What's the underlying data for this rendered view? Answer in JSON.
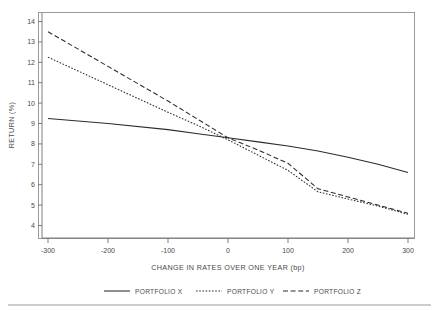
{
  "chart_data": {
    "type": "line",
    "title": "",
    "xlabel": "CHANGE IN RATES OVER ONE YEAR (bp)",
    "ylabel": "RETURN (%)",
    "xlim": [
      -300,
      300
    ],
    "ylim": [
      4,
      14
    ],
    "xticks": [
      -300,
      -200,
      -100,
      0,
      100,
      200,
      300
    ],
    "xtick_labels": [
      "-300",
      "-200",
      "-100",
      "0",
      "100",
      "200",
      "300"
    ],
    "yticks": [
      4,
      5,
      6,
      7,
      8,
      9,
      10,
      11,
      12,
      13,
      14
    ],
    "ytick_labels": [
      "4",
      "5",
      "6",
      "7",
      "8",
      "9",
      "10",
      "11",
      "12",
      "13",
      "14"
    ],
    "grid": false,
    "legend_position": "below",
    "series": [
      {
        "name": "PORTFOLIO X",
        "style": "solid",
        "x": [
          -300,
          -200,
          -100,
          -50,
          0,
          50,
          100,
          150,
          200,
          250,
          300
        ],
        "values": [
          9.25,
          9.0,
          8.7,
          8.5,
          8.3,
          8.1,
          7.9,
          7.65,
          7.35,
          7.0,
          6.6
        ]
      },
      {
        "name": "PORTFOLIO Y",
        "style": "dotted",
        "x": [
          -300,
          -200,
          -100,
          -50,
          0,
          50,
          100,
          150,
          200,
          250,
          300
        ],
        "values": [
          12.25,
          10.9,
          9.55,
          8.9,
          8.2,
          7.45,
          6.7,
          5.65,
          5.3,
          4.95,
          4.55
        ]
      },
      {
        "name": "PORTFOLIO Z",
        "style": "dashed",
        "x": [
          -300,
          -200,
          -100,
          -50,
          0,
          50,
          100,
          150,
          200,
          250,
          300
        ],
        "values": [
          13.5,
          11.8,
          10.1,
          9.2,
          8.3,
          7.7,
          7.05,
          5.8,
          5.4,
          5.0,
          4.6
        ]
      }
    ]
  },
  "axes": {
    "xlabel": "CHANGE IN RATES OVER ONE YEAR (bp)",
    "ylabel": "RETURN (%)"
  },
  "legend": {
    "entries": [
      {
        "label": "PORTFOLIO X"
      },
      {
        "label": "PORTFOLIO Y"
      },
      {
        "label": "PORTFOLIO Z"
      }
    ]
  },
  "ticks": {
    "x": [
      "-300",
      "-200",
      "-100",
      "0",
      "100",
      "200",
      "300"
    ],
    "y": [
      "4",
      "5",
      "6",
      "7",
      "8",
      "9",
      "10",
      "11",
      "12",
      "13",
      "14"
    ]
  },
  "colors": {
    "line": "#2b2b2b",
    "axis": "#6f6f6f",
    "frame": "#9a9a9a",
    "text": "#4a4a4a",
    "background": "#ffffff"
  }
}
